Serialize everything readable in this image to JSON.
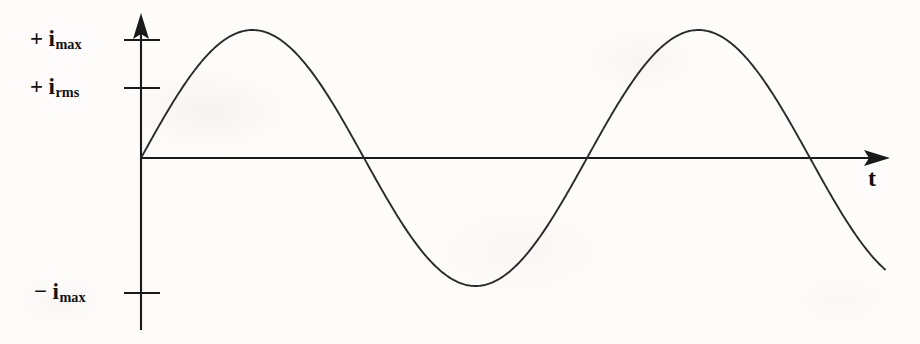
{
  "figure": {
    "kind": "line-plot",
    "background_color": "#fdfcfa",
    "stroke_color": "#1a1a1a",
    "axes": {
      "vertical": {
        "name": "current-axis",
        "arrow": true,
        "x": 141,
        "y_top": 13,
        "y_bottom": 330
      },
      "horizontal": {
        "name": "time-axis",
        "arrow": true,
        "y": 158,
        "x_left": 141,
        "x_right": 890,
        "label": "t"
      }
    },
    "ticks": [
      {
        "id": "tick-imax-pos",
        "sign": "+",
        "symbol": "i",
        "subscript": "max",
        "label": "+ imax",
        "y": 40
      },
      {
        "id": "tick-irms-pos",
        "sign": "+",
        "symbol": "i",
        "subscript": "rms",
        "label": "+ irms",
        "y": 88
      },
      {
        "id": "tick-imax-neg",
        "sign": "−",
        "symbol": "i",
        "subscript": "max",
        "label": "− imax",
        "y": 293
      }
    ],
    "labels": {
      "imax_pos_sign": "+",
      "imax_pos_var": "i",
      "imax_pos_sub": "max",
      "irms_pos_sign": "+",
      "irms_pos_var": "i",
      "irms_pos_sub": "rms",
      "imax_neg_sign": "−",
      "imax_neg_var": "i",
      "imax_neg_sub": "max",
      "time_axis": "t"
    }
  },
  "chart_data": {
    "type": "line",
    "title": "",
    "xlabel": "t",
    "ylabel": "",
    "grid": false,
    "legend": null,
    "series": [
      {
        "name": "current",
        "function": "i(t) = i_max * sin(2*pi*t/T)",
        "amplitude_px": 128,
        "period_px": 446,
        "origin_px": [
          141,
          158
        ],
        "x": [
          141,
          192,
          245,
          300,
          345,
          400,
          458,
          512,
          568,
          625,
          680,
          735,
          787,
          840,
          885
        ],
        "y": [
          158,
          62,
          30,
          64,
          158,
          248,
          290,
          250,
          158,
          63,
          28,
          65,
          158,
          243,
          283
        ]
      }
    ],
    "annotations": [
      {
        "text": "+ i_max",
        "value_y_px": 40,
        "kind": "tick"
      },
      {
        "text": "+ i_rms",
        "value_y_px": 88,
        "kind": "tick"
      },
      {
        "text": "- i_max",
        "value_y_px": 293,
        "kind": "tick"
      }
    ],
    "axis_ranges": {
      "x_px": [
        141,
        890
      ],
      "y_px": [
        13,
        330
      ]
    }
  }
}
